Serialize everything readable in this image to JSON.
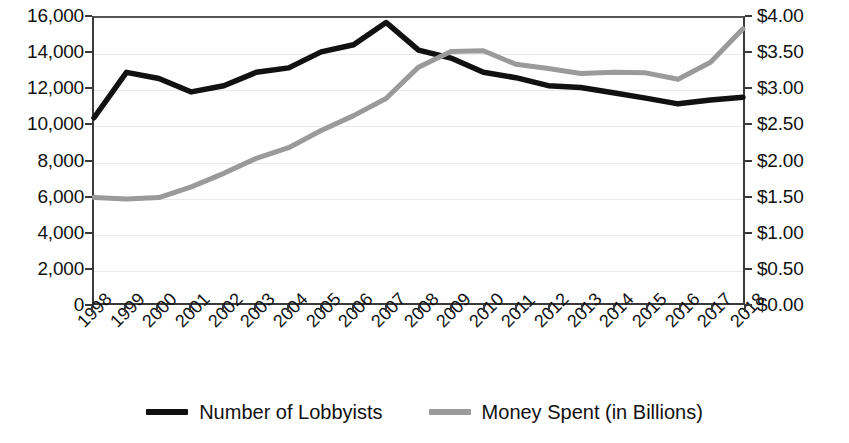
{
  "chart_data": {
    "type": "line",
    "title": "",
    "subtitle": "",
    "xlabel": "",
    "ylabel": "",
    "grid": true,
    "legend_position": "bottom",
    "categories": [
      "1998",
      "1999",
      "2000",
      "2001",
      "2002",
      "2003",
      "2004",
      "2005",
      "2006",
      "2007",
      "2008",
      "2009",
      "2010",
      "2011",
      "2012",
      "2013",
      "2014",
      "2015",
      "2016",
      "2017",
      "2018"
    ],
    "axes": {
      "left": {
        "label": "",
        "ylim": [
          0,
          16000
        ],
        "tick_step": 2000,
        "tick_labels": [
          "0",
          "2,000",
          "4,000",
          "6,000",
          "8,000",
          "10,000",
          "12,000",
          "14,000",
          "16,000"
        ],
        "tick_values": [
          0,
          2000,
          4000,
          6000,
          8000,
          10000,
          12000,
          14000,
          16000
        ],
        "series_name": "Number of Lobbyists"
      },
      "right": {
        "label": "",
        "ylim": [
          0,
          4.0
        ],
        "tick_step": 0.5,
        "tick_labels": [
          "$0.00",
          "$0.50",
          "$1.00",
          "$1.50",
          "$2.00",
          "$2.50",
          "$3.00",
          "$3.50",
          "$4.00"
        ],
        "tick_values": [
          0,
          0.5,
          1.0,
          1.5,
          2.0,
          2.5,
          3.0,
          3.5,
          4.0
        ],
        "series_name": "Money Spent (in Billions)"
      }
    },
    "series": [
      {
        "name": "Number of Lobbyists",
        "axis": "left",
        "color": "#111111",
        "values": [
          10400,
          12950,
          12600,
          11850,
          12200,
          12950,
          13200,
          14100,
          14500,
          15750,
          14200,
          13750,
          12950,
          12650,
          12200,
          12100,
          11800,
          11500,
          11180,
          11400,
          11550
        ]
      },
      {
        "name": "Money Spent (in Billions)",
        "axis": "right",
        "color": "#9a9a9a",
        "values": [
          1.48,
          1.46,
          1.48,
          1.63,
          1.82,
          2.03,
          2.18,
          2.42,
          2.63,
          2.87,
          3.31,
          3.53,
          3.54,
          3.35,
          3.29,
          3.22,
          3.24,
          3.23,
          3.14,
          3.38,
          3.85
        ]
      }
    ]
  },
  "legend": {
    "items": [
      {
        "label": "Number of Lobbyists",
        "color": "#111111"
      },
      {
        "label": "Money Spent (in Billions)",
        "color": "#9a9a9a"
      }
    ]
  }
}
